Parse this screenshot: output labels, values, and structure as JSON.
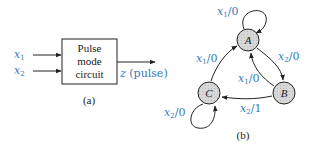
{
  "part_a": {
    "inputs": [
      {
        "name": "x",
        "sub": "1"
      },
      {
        "name": "x",
        "sub": "2"
      }
    ],
    "box_lines": [
      "Pulse",
      "mode",
      "circuit"
    ],
    "output": {
      "name": "z",
      "note": " (pulse)"
    },
    "caption": "(a)"
  },
  "part_b": {
    "states": [
      {
        "id": "A",
        "label": "A"
      },
      {
        "id": "B",
        "label": "B"
      },
      {
        "id": "C",
        "label": "C"
      }
    ],
    "transitions": [
      {
        "from": "A",
        "to": "A",
        "input": "x",
        "sub": "1",
        "output": "/0"
      },
      {
        "from": "A",
        "to": "B",
        "input": "x",
        "sub": "2",
        "output": "/0"
      },
      {
        "from": "B",
        "to": "A",
        "input": "x",
        "sub": "1",
        "output": "/0"
      },
      {
        "from": "B",
        "to": "C",
        "input": "x",
        "sub": "2",
        "output": "/1"
      },
      {
        "from": "C",
        "to": "A",
        "input": "x",
        "sub": "1",
        "output": "/0"
      },
      {
        "from": "C",
        "to": "C",
        "input": "x",
        "sub": "2",
        "output": "/0"
      }
    ],
    "caption": "(b)"
  },
  "colors": {
    "label_blue": "#3a78c2",
    "node_fill": "#d4d4d4",
    "line": "#222222"
  }
}
